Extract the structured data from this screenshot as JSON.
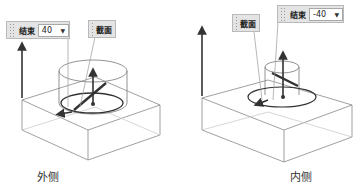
{
  "left": {
    "end_panel": {
      "label": "结束",
      "value": "40",
      "dropdown_icon": "caret-down-icon"
    },
    "section_panel": {
      "label": "截面"
    },
    "caption": "外侧"
  },
  "right": {
    "end_panel": {
      "label": "结束",
      "value": "-40",
      "dropdown_icon": "caret-down-icon"
    },
    "section_panel": {
      "label": "截面"
    },
    "caption": "内侧"
  }
}
